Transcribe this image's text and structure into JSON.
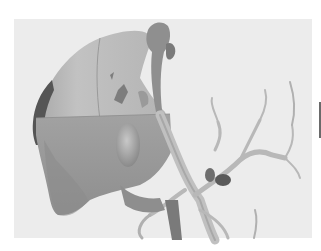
{
  "figure": {
    "colors": {
      "margin": "#ffffff",
      "panel_background": "#ececec",
      "liver_upper": "#b9b9b9",
      "liver_lower": "#9e9e9e",
      "liver_edge_dark": "#555555",
      "gallbladder": "#a8a8a8",
      "vessels": "#c4c4c4",
      "vessels_dark": "#5a5a5a"
    }
  }
}
